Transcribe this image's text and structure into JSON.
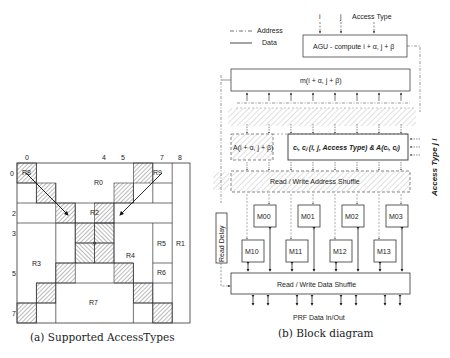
{
  "figure_a": {
    "caption": "(a) Supported AccessTypes",
    "col_labels": [
      {
        "text": "0",
        "col": 0
      },
      {
        "text": "4",
        "col": 4
      },
      {
        "text": "5",
        "col": 5
      },
      {
        "text": "7",
        "col": 7
      },
      {
        "text": "8",
        "col": 8
      }
    ],
    "row_labels": [
      {
        "text": "0",
        "row": 0
      },
      {
        "text": "2",
        "row": 2
      },
      {
        "text": "3",
        "row": 3
      },
      {
        "text": "5",
        "row": 5
      },
      {
        "text": "7",
        "row": 7
      }
    ],
    "regions": [
      "R0",
      "R1",
      "R2",
      "R3",
      "R4",
      "R5",
      "R6",
      "R7",
      "R8",
      "R9"
    ]
  },
  "figure_b": {
    "caption": "(b) Block diagram",
    "legend": {
      "address": "Address",
      "data": "Data"
    },
    "inputs": {
      "i": "i",
      "j": "j",
      "access_type": "Access Type"
    },
    "agu_label": "AGU - compute i + α, j + β",
    "m_label": "m(i + α, j + β)",
    "a_label": "A(i + α, j + β)",
    "c_label": "cᵢ, cⱼ (i, j, Access Type) & A(cᵢ, cⱼ)",
    "addr_shuffle_label": "Read / Write Address Shuffle",
    "data_shuffle_label": "Read / Write Data Shuffle",
    "read_delay_label": "Read Delay",
    "side_label": "Access Type  j  i",
    "prf_label": "PRF Data In/Out",
    "modules_top": [
      "M00",
      "M01",
      "M02",
      "M03"
    ],
    "modules_bottom": [
      "M10",
      "M11",
      "M12",
      "M13"
    ]
  }
}
